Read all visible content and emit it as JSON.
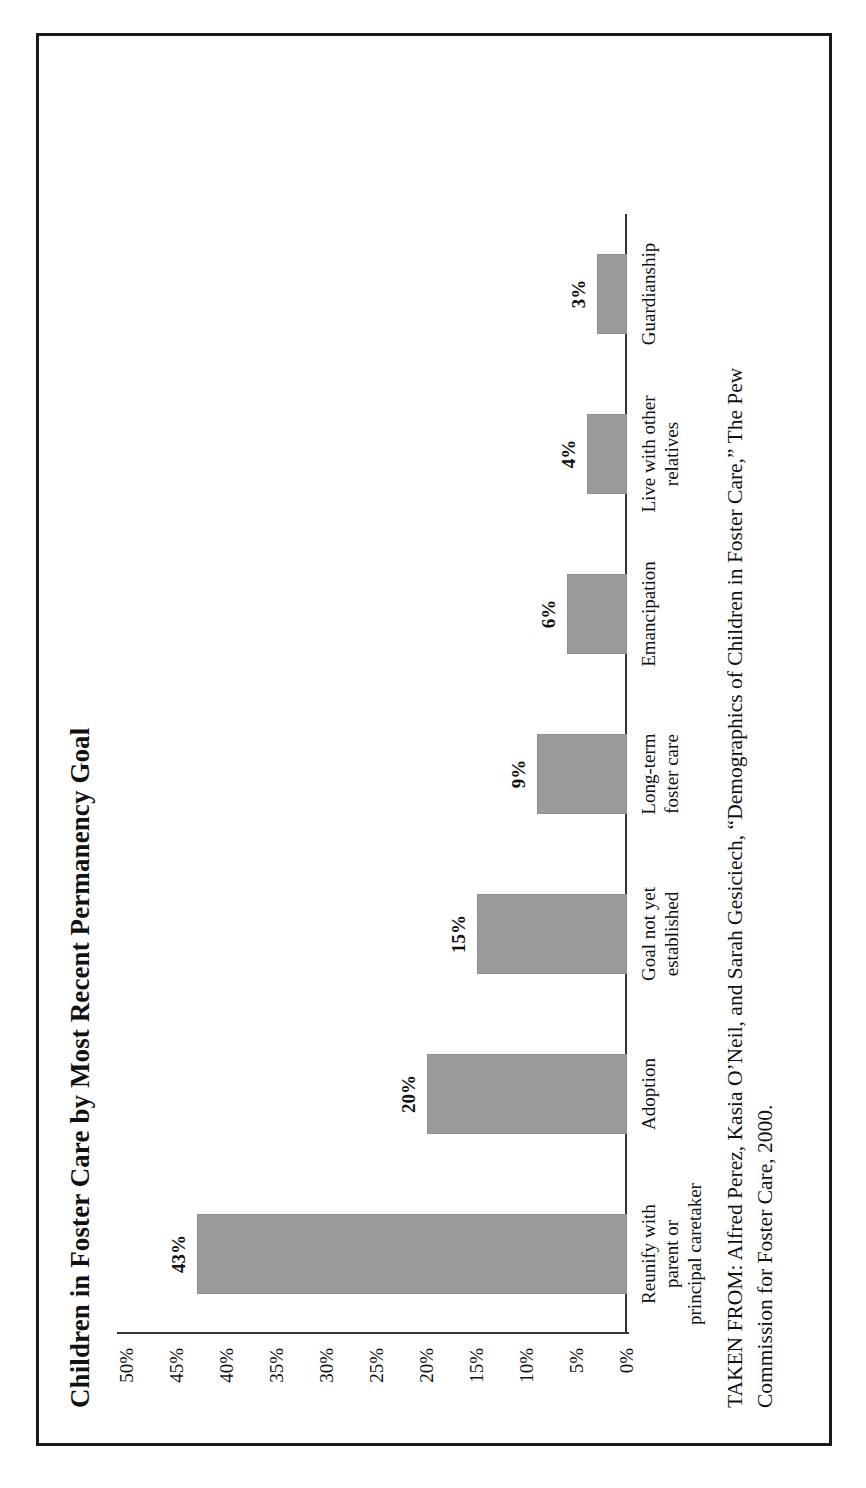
{
  "chart_data": {
    "type": "bar",
    "title": "Children in Foster Care by Most Recent Permanency Goal",
    "xlabel": "",
    "ylabel": "",
    "ylim": [
      0,
      50
    ],
    "grid": false,
    "legend": "none",
    "orientation": "vertical",
    "categories": [
      "Reunify with parent or principal caretaker",
      "Adoption",
      "Goal not yet established",
      "Long-term foster care",
      "Emancipation",
      "Live with other relatives",
      "Guardianship"
    ],
    "category_lines": [
      [
        "Reunify with",
        "parent or",
        "principal caretaker"
      ],
      [
        "Adoption"
      ],
      [
        "Goal not yet",
        "established"
      ],
      [
        "Long-term",
        "foster care"
      ],
      [
        "Emancipation"
      ],
      [
        "Live with other",
        "relatives"
      ],
      [
        "Guardianship"
      ]
    ],
    "values": [
      43,
      20,
      15,
      9,
      6,
      4,
      3
    ],
    "value_labels": [
      "43%",
      "20%",
      "15%",
      "9%",
      "6%",
      "4%",
      "3%"
    ],
    "tick_labels": [
      "50%",
      "45%",
      "40%",
      "35%",
      "30%",
      "25%",
      "20%",
      "15%",
      "10%",
      "5%",
      "0%"
    ],
    "tick_values": [
      50,
      45,
      40,
      35,
      30,
      25,
      20,
      15,
      10,
      5,
      0
    ],
    "bar_color": "#9a9a9a",
    "axis_color": "#333333"
  },
  "caption": {
    "line1": "TAKEN FROM: Alfred Perez, Kasia O’Neil, and Sarah Gesiciech, “Demographics of Children in Foster Care,” The Pew",
    "line2": "Commission for Foster Care, 2000."
  }
}
